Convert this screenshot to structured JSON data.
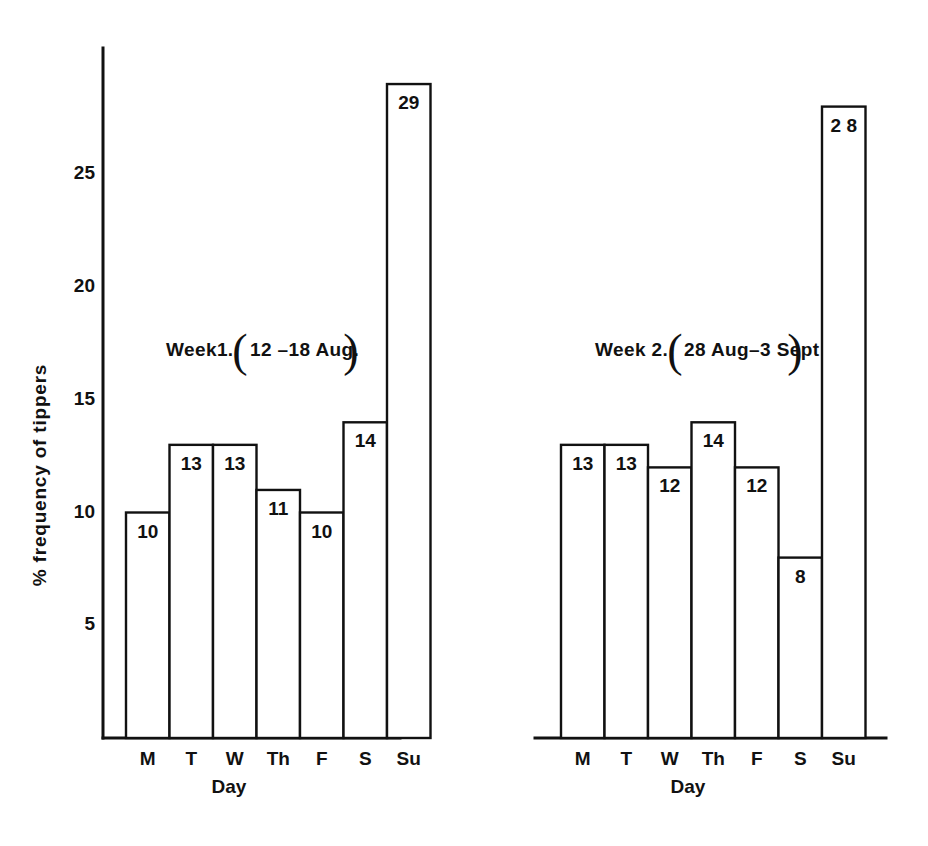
{
  "chart_data": {
    "type": "bar",
    "title": "",
    "xlabel": "Day",
    "ylabel": "% frequency of tippers",
    "ylim": [
      0,
      30
    ],
    "yticks": [
      5,
      10,
      15,
      20,
      25
    ],
    "ytick_labels": [
      "5",
      "10",
      "15",
      "20",
      "25"
    ],
    "grid": false,
    "legend": "none",
    "categories": [
      "M",
      "T",
      "W",
      "Th",
      "F",
      "S",
      "Su"
    ],
    "panels": [
      {
        "name": "week-1",
        "title_prefix": "Week1.",
        "title_paren_open": "(",
        "title_range": "12 –18  Aug.",
        "title_paren_close": ")",
        "title_full": "Week1. (12 –18 Aug.)",
        "categories": [
          "M",
          "T",
          "W",
          "Th",
          "F",
          "S",
          "Su"
        ],
        "values": [
          10,
          13,
          13,
          11,
          10,
          14,
          29
        ],
        "value_labels": [
          "10",
          "13",
          "13",
          "11",
          "10",
          "14",
          "29"
        ],
        "xlabel": "Day"
      },
      {
        "name": "week-2",
        "title_prefix": "Week 2.",
        "title_paren_open": "(",
        "title_range": "28 Aug–3 Sept",
        "title_paren_close": ")",
        "title_full": "Week 2. (28 Aug–3Sept)",
        "categories": [
          "M",
          "T",
          "W",
          "Th",
          "F",
          "S",
          "Su"
        ],
        "values": [
          13,
          13,
          12,
          14,
          12,
          8,
          28
        ],
        "value_labels": [
          "13",
          "13",
          "12",
          "14",
          "12",
          "8",
          "2 8"
        ],
        "xlabel": "Day"
      }
    ],
    "colors": {
      "bar_fill": "#ffffff",
      "bar_stroke": "#111111",
      "axis": "#111111",
      "text": "#111111",
      "background": "#ffffff"
    }
  }
}
